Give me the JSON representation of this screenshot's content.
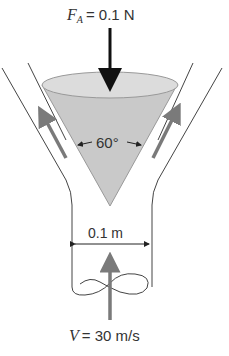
{
  "diagram": {
    "force_label": {
      "symbol": "F",
      "subscript": "A",
      "value": "= 0.1 N"
    },
    "angle_label": "60°",
    "width_label": "0.1 m",
    "velocity_label": {
      "symbol": "V",
      "value": "= 30 m/s"
    },
    "colors": {
      "cone_fill": "#c9c9c9",
      "cone_top_fill": "#dcdcdc",
      "flow_arrow": "#7a7a7a",
      "force_arrow": "#111111",
      "lines": "#444444"
    }
  }
}
